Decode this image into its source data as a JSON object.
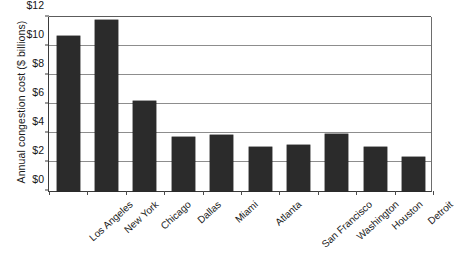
{
  "chart_data": {
    "type": "bar",
    "title": "",
    "subtitle": "",
    "xlabel": "",
    "ylabel": "Annual congestion cost ($ billions)",
    "categories": [
      "Los Angeles",
      "New York",
      "Chicago",
      "Dallas",
      "Miami",
      "Atlanta",
      "San Francisco",
      "Washington",
      "Houston",
      "Detroit"
    ],
    "values": [
      10.7,
      11.8,
      6.2,
      3.7,
      3.85,
      3.05,
      3.2,
      3.9,
      3.05,
      2.35
    ],
    "ylim": [
      0,
      12
    ],
    "ytick_values": [
      0,
      2,
      4,
      6,
      8,
      10,
      12
    ],
    "ytick_labels": [
      "$0",
      "$2",
      "$4",
      "$6",
      "$8",
      "$10",
      "$12"
    ],
    "grid": true,
    "legend": false,
    "legend_position": "none",
    "bar_color": "#2b2b2b",
    "gridline_color": "#8d8d8d",
    "axis_color": "#3a3a3a",
    "background_color": "#ffffff",
    "xtick_label_rotation": -42
  }
}
